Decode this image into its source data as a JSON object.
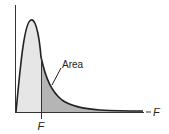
{
  "diagram": {
    "type": "f-distribution-curve",
    "labels": {
      "area": "Area",
      "critical_value": "F",
      "x_axis": "F"
    },
    "colors": {
      "curve": "#222222",
      "body_fill": "#e6e6e6",
      "tail_fill": "#b5b5b5",
      "axis": "#333333"
    }
  }
}
